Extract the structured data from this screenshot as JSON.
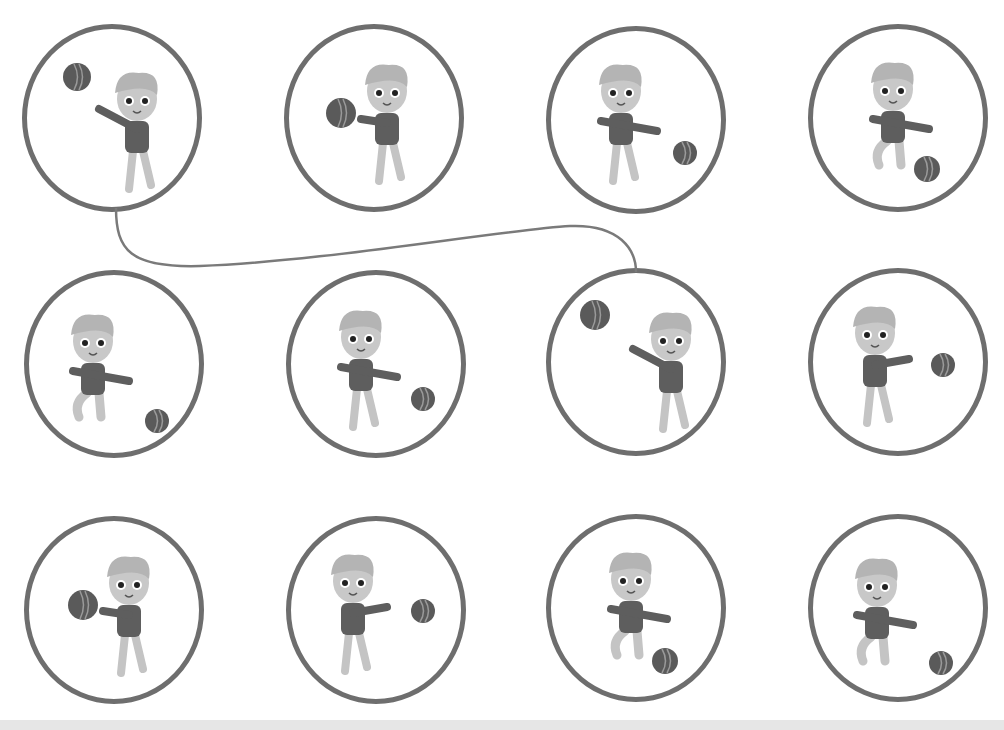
{
  "worksheet": {
    "title": "",
    "colors": {
      "circle_stroke": "#6e6e6e",
      "line": "#7a7a7a",
      "hair": "#b4b4b4",
      "skin": "#c8c8c8",
      "shirt": "#5e5e5e",
      "pants": "#c4c4c4",
      "ball": "#5a5a5a",
      "ball_seam": "#9a9a9a"
    },
    "cells": [
      {
        "row": 0,
        "col": 0,
        "x": 22,
        "y": 24,
        "pose": "throw-up",
        "ball": {
          "x": 50,
          "y": 48,
          "r": 14
        },
        "boy": {
          "x": 110,
          "y": 70,
          "facing": "left"
        }
      },
      {
        "row": 0,
        "col": 1,
        "x": 284,
        "y": 24,
        "pose": "hold-chest",
        "ball": {
          "x": 52,
          "y": 84,
          "r": 15
        },
        "boy": {
          "x": 98,
          "y": 62,
          "facing": "left"
        }
      },
      {
        "row": 0,
        "col": 2,
        "x": 546,
        "y": 26,
        "pose": "roll-right",
        "ball": {
          "x": 134,
          "y": 122,
          "r": 12
        },
        "boy": {
          "x": 70,
          "y": 60,
          "facing": "right"
        }
      },
      {
        "row": 0,
        "col": 3,
        "x": 808,
        "y": 24,
        "pose": "bounce",
        "ball": {
          "x": 114,
          "y": 140,
          "r": 13
        },
        "boy": {
          "x": 80,
          "y": 60,
          "facing": "right"
        }
      },
      {
        "row": 1,
        "col": 0,
        "x": 24,
        "y": 270,
        "pose": "crouch-roll",
        "ball": {
          "x": 128,
          "y": 146,
          "r": 12
        },
        "boy": {
          "x": 64,
          "y": 66,
          "facing": "right"
        }
      },
      {
        "row": 1,
        "col": 1,
        "x": 286,
        "y": 270,
        "pose": "roll-right",
        "ball": {
          "x": 132,
          "y": 124,
          "r": 12
        },
        "boy": {
          "x": 70,
          "y": 62,
          "facing": "right"
        }
      },
      {
        "row": 1,
        "col": 2,
        "x": 546,
        "y": 268,
        "pose": "throw-up",
        "ball": {
          "x": 44,
          "y": 42,
          "r": 15
        },
        "boy": {
          "x": 120,
          "y": 66,
          "facing": "left"
        }
      },
      {
        "row": 1,
        "col": 3,
        "x": 808,
        "y": 268,
        "pose": "catch",
        "ball": {
          "x": 130,
          "y": 92,
          "r": 12
        },
        "boy": {
          "x": 62,
          "y": 60,
          "facing": "right"
        }
      },
      {
        "row": 2,
        "col": 0,
        "x": 24,
        "y": 516,
        "pose": "hold-chest",
        "ball": {
          "x": 54,
          "y": 84,
          "r": 15
        },
        "boy": {
          "x": 100,
          "y": 62,
          "facing": "left"
        }
      },
      {
        "row": 2,
        "col": 1,
        "x": 286,
        "y": 516,
        "pose": "catch",
        "ball": {
          "x": 132,
          "y": 90,
          "r": 12
        },
        "boy": {
          "x": 62,
          "y": 60,
          "facing": "right"
        }
      },
      {
        "row": 2,
        "col": 2,
        "x": 546,
        "y": 514,
        "pose": "bounce",
        "ball": {
          "x": 114,
          "y": 142,
          "r": 13
        },
        "boy": {
          "x": 80,
          "y": 60,
          "facing": "right"
        }
      },
      {
        "row": 2,
        "col": 3,
        "x": 808,
        "y": 514,
        "pose": "crouch-roll",
        "ball": {
          "x": 128,
          "y": 144,
          "r": 12
        },
        "boy": {
          "x": 64,
          "y": 66,
          "facing": "right"
        }
      }
    ],
    "connections": [
      {
        "from": {
          "row": 0,
          "col": 0
        },
        "to": {
          "row": 1,
          "col": 2
        },
        "path": "M116 208 C116 250 130 268 200 266 C320 262 500 230 570 226 C620 224 636 250 636 272"
      }
    ]
  }
}
